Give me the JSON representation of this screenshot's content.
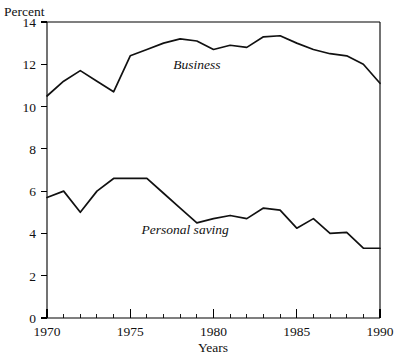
{
  "chart_data": {
    "type": "line",
    "title": "",
    "subtitle": "",
    "xlabel": "Years",
    "ylabel": "Percent",
    "xlim": [
      1970,
      1990
    ],
    "ylim": [
      0,
      14
    ],
    "grid": false,
    "legend_position": "inline-annotations",
    "x": [
      1970,
      1971,
      1972,
      1973,
      1974,
      1975,
      1976,
      1977,
      1978,
      1979,
      1980,
      1981,
      1982,
      1983,
      1984,
      1985,
      1986,
      1987,
      1988,
      1989,
      1990
    ],
    "xticks_major": [
      1970,
      1975,
      1980,
      1985,
      1990
    ],
    "xtick_labels": [
      "1970",
      "1975",
      "1980",
      "1985",
      "1990"
    ],
    "xticks_minor": [
      1971,
      1972,
      1973,
      1974,
      1976,
      1977,
      1978,
      1979,
      1981,
      1982,
      1983,
      1984,
      1986,
      1987,
      1988,
      1989
    ],
    "yticks": [
      0,
      2,
      4,
      6,
      8,
      10,
      12,
      14
    ],
    "ytick_labels": [
      "0",
      "2",
      "4",
      "6",
      "8",
      "10",
      "12",
      "14"
    ],
    "series": [
      {
        "name": "Business",
        "label": "Business",
        "color": "#111111",
        "values": [
          10.5,
          11.2,
          11.7,
          11.2,
          10.7,
          12.4,
          12.7,
          13.0,
          13.2,
          13.1,
          12.7,
          12.9,
          12.8,
          13.3,
          13.35,
          13.0,
          12.7,
          12.5,
          12.4,
          12.0,
          11.1
        ],
        "annotation": {
          "text": "Business",
          "x": 1979.0,
          "y": 11.8
        }
      },
      {
        "name": "Personal saving",
        "label": "Personal saving",
        "color": "#111111",
        "values": [
          5.7,
          6.0,
          5.0,
          6.0,
          6.6,
          6.6,
          6.6,
          5.9,
          5.2,
          4.5,
          4.7,
          4.85,
          4.7,
          5.2,
          5.1,
          4.25,
          4.7,
          4.0,
          4.05,
          3.3,
          3.3
        ],
        "annotation": {
          "text": "Personal saving",
          "x": 1978.3,
          "y": 3.95
        }
      }
    ]
  },
  "labels": {
    "y_axis_title": "Percent",
    "x_axis_title": "Years",
    "business_label": "Business",
    "personal_saving_label": "Personal saving"
  }
}
